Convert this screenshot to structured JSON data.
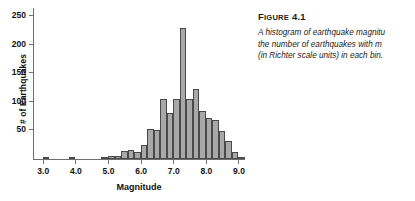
{
  "figure": {
    "caption_label": "FIGURE",
    "caption_number": "4.1",
    "caption_lines": [
      "A histogram of earthquake magnitu",
      "the number of earthquakes with m",
      "(in Richter scale units) in each bin."
    ]
  },
  "chart_data": {
    "type": "bar",
    "title": "",
    "xlabel": "Magnitude",
    "ylabel": "# of Earthquakes",
    "xlim": [
      2.7,
      9.2
    ],
    "ylim": [
      0,
      250
    ],
    "grid": false,
    "legend": null,
    "bin_width": 0.2,
    "bar_fill": "#a8a8a8",
    "bar_edge": "#4a4a4a",
    "axis_color": "#6f6f6f",
    "xticks": [
      "3.0",
      "4.0",
      "5.0",
      "6.0",
      "7.0",
      "8.0",
      "9.0"
    ],
    "xtick_values": [
      3.0,
      4.0,
      5.0,
      6.0,
      7.0,
      8.0,
      9.0
    ],
    "yticks": [
      "50",
      "100",
      "150",
      "200",
      "250"
    ],
    "ytick_values": [
      50,
      100,
      150,
      200,
      250
    ],
    "bins": [
      {
        "x0": 3.0,
        "x1": 3.2,
        "value": 1
      },
      {
        "x0": 3.8,
        "x1": 4.0,
        "value": 1
      },
      {
        "x0": 4.8,
        "x1": 5.0,
        "value": 1
      },
      {
        "x0": 5.0,
        "x1": 5.2,
        "value": 6
      },
      {
        "x0": 5.2,
        "x1": 5.4,
        "value": 6
      },
      {
        "x0": 5.4,
        "x1": 5.6,
        "value": 14
      },
      {
        "x0": 5.6,
        "x1": 5.8,
        "value": 16
      },
      {
        "x0": 5.8,
        "x1": 6.0,
        "value": 12
      },
      {
        "x0": 6.0,
        "x1": 6.2,
        "value": 25
      },
      {
        "x0": 6.2,
        "x1": 6.4,
        "value": 53
      },
      {
        "x0": 6.4,
        "x1": 6.6,
        "value": 51
      },
      {
        "x0": 6.6,
        "x1": 6.8,
        "value": 105
      },
      {
        "x0": 6.8,
        "x1": 7.0,
        "value": 81
      },
      {
        "x0": 7.0,
        "x1": 7.2,
        "value": 105
      },
      {
        "x0": 7.2,
        "x1": 7.4,
        "value": 229
      },
      {
        "x0": 7.4,
        "x1": 7.6,
        "value": 105
      },
      {
        "x0": 7.6,
        "x1": 7.8,
        "value": 122
      },
      {
        "x0": 7.8,
        "x1": 8.0,
        "value": 84
      },
      {
        "x0": 8.0,
        "x1": 8.2,
        "value": 72
      },
      {
        "x0": 8.2,
        "x1": 8.4,
        "value": 68
      },
      {
        "x0": 8.4,
        "x1": 8.6,
        "value": 49
      },
      {
        "x0": 8.6,
        "x1": 8.8,
        "value": 31
      },
      {
        "x0": 8.8,
        "x1": 9.0,
        "value": 12
      },
      {
        "x0": 9.0,
        "x1": 9.2,
        "value": 3
      }
    ]
  }
}
